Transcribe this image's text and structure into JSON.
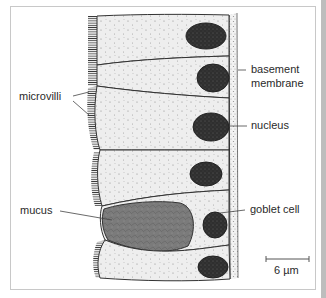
{
  "figure": {
    "labels": {
      "microvilli": "microvilli",
      "basement_membrane_line1": "basement",
      "basement_membrane_line2": "membrane",
      "nucleus": "nucleus",
      "mucus": "mucus",
      "goblet_cell": "goblet cell"
    },
    "scale_bar": {
      "label": "6 µm",
      "value": 6,
      "unit": "µm"
    },
    "cells": [
      {
        "type": "columnar",
        "has_microvilli": true
      },
      {
        "type": "columnar",
        "has_microvilli": true
      },
      {
        "type": "columnar",
        "has_microvilli": true
      },
      {
        "type": "columnar",
        "has_microvilli": true
      },
      {
        "type": "goblet",
        "has_microvilli": false
      },
      {
        "type": "columnar",
        "has_microvilli": true
      }
    ],
    "colors": {
      "cytoplasm": "#ededed",
      "nucleus": "#2e2e2e",
      "mucus": "#7a7a7a",
      "outline": "#333333",
      "frame": "#c8c8c8"
    }
  }
}
